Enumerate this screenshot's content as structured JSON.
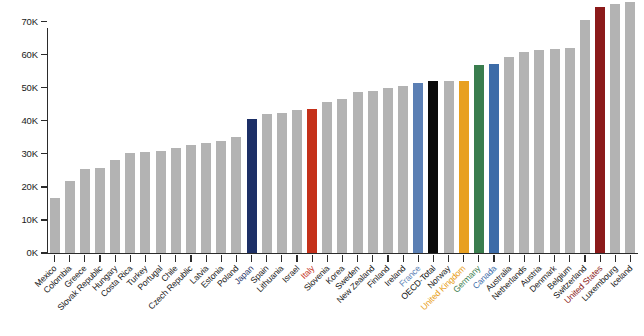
{
  "chart_data": {
    "type": "bar",
    "title": "",
    "subtitle": "",
    "xlabel": "",
    "ylabel": "",
    "ylim": [
      0,
      75000
    ],
    "grid": false,
    "legend": "none",
    "y_ticks": [
      {
        "value": 0,
        "label": "0K"
      },
      {
        "value": 10000,
        "label": "10K"
      },
      {
        "value": 20000,
        "label": "20K"
      },
      {
        "value": 30000,
        "label": "30K"
      },
      {
        "value": 40000,
        "label": "40K"
      },
      {
        "value": 50000,
        "label": "50K"
      },
      {
        "value": 60000,
        "label": "60K"
      },
      {
        "value": 70000,
        "label": "70K"
      }
    ],
    "categories": [
      "Mexico",
      "Colombia",
      "Greece",
      "Slovak Republic",
      "Hungary",
      "Costa Rica",
      "Turkey",
      "Portugal",
      "Chile",
      "Czech Republic",
      "Latvia",
      "Estonia",
      "Poland",
      "Japan",
      "Spain",
      "Lithuania",
      "Israel",
      "Italy",
      "Slovenia",
      "Korea",
      "Sweden",
      "New Zealand",
      "Finland",
      "Ireland",
      "France",
      "OECD-Total",
      "Norway",
      "United Kingdom",
      "Germany",
      "Canada",
      "Australia",
      "Netherlands",
      "Austria",
      "Denmark",
      "Belgium",
      "Switzerland",
      "United States",
      "Luxembourg",
      "Iceland"
    ],
    "values": [
      16500,
      21700,
      25400,
      25600,
      28000,
      30300,
      30700,
      30800,
      31700,
      32800,
      33400,
      33900,
      35200,
      40600,
      42000,
      42300,
      43200,
      43600,
      45700,
      46600,
      48800,
      49100,
      49900,
      50600,
      51300,
      51900,
      51900,
      52000,
      57000,
      57200,
      59300,
      60800,
      61400,
      61800,
      61900,
      70500,
      74300,
      75200,
      75900
    ],
    "series_name": "Average annual wages",
    "bar_colors": {
      "default": "#b3b3b3",
      "Japan": "#1c2f66",
      "Italy": "#c4301a",
      "France": "#5b7fb4",
      "OECD-Total": "#0a0a0a",
      "Norway": "#b3b3b3",
      "United Kingdom": "#e8a020",
      "Germany": "#3a7d4e",
      "Canada": "#3d6ca8",
      "United States": "#8b1a1a"
    },
    "label_colors": {
      "default": "#1a1a1a",
      "Japan": "#1c2f66",
      "Italy": "#c4301a",
      "France": "#5b7fb4",
      "OECD-Total": "#0a0a0a",
      "United Kingdom": "#e8a020",
      "Germany": "#3a7d4e",
      "Canada": "#3d6ca8",
      "United States": "#8b1a1a"
    }
  }
}
